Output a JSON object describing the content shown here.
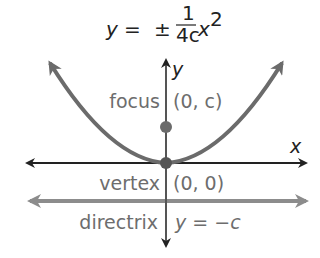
{
  "equation": {
    "lhs": "y",
    "eq": "=",
    "pm": "±",
    "num": "1",
    "den": "4c",
    "var": "x",
    "exp": "2"
  },
  "axes": {
    "x_label": "x",
    "y_label": "y"
  },
  "points": {
    "focus_label": "focus",
    "focus_coord": "(0, c)",
    "vertex_label": "vertex",
    "vertex_coord": "(0, 0)"
  },
  "directrix": {
    "label": "directrix",
    "equation": "y = −c"
  },
  "colors": {
    "parabola": "#6b6b6b",
    "axis": "#222222",
    "directrix": "#8c8c8c",
    "points": "#6b6b6b",
    "label": "#6d6d6d"
  }
}
